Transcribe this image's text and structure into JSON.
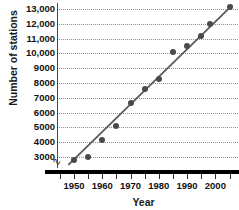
{
  "chart_data": {
    "type": "scatter",
    "title": "",
    "xlabel": "Year",
    "ylabel": "Number of stations",
    "xlim": [
      1944,
      2008
    ],
    "ylim": [
      2400,
      13400
    ],
    "grid": true,
    "legend": "none",
    "x_tick_labels": [
      "1950",
      "1960",
      "1970",
      "1980",
      "1990",
      "2000"
    ],
    "x_tick_values": [
      1950,
      1960,
      1970,
      1980,
      1990,
      2000
    ],
    "x_minor_tick_values": [
      1945,
      1950,
      1955,
      1960,
      1965,
      1970,
      1975,
      1980,
      1985,
      1990,
      1995,
      2000,
      2005
    ],
    "y_tick_labels": [
      "3000",
      "4000",
      "5000",
      "6000",
      "7000",
      "8000",
      "9000",
      "10,000",
      "11,000",
      "12,000",
      "13,000"
    ],
    "y_tick_values": [
      3000,
      4000,
      5000,
      6000,
      7000,
      8000,
      9000,
      10000,
      11000,
      12000,
      13000
    ],
    "axis_break": true,
    "x": [
      1950,
      1955,
      1960,
      1965,
      1970,
      1975,
      1980,
      1985,
      1990,
      1995,
      1998,
      2005
    ],
    "values": [
      2800,
      3000,
      4150,
      5100,
      6650,
      7600,
      8300,
      10100,
      10500,
      11200,
      12000,
      13100
    ],
    "points": [
      {
        "year": 1950,
        "stations": 2800
      },
      {
        "year": 1955,
        "stations": 3000
      },
      {
        "year": 1960,
        "stations": 4150
      },
      {
        "year": 1965,
        "stations": 5100
      },
      {
        "year": 1970,
        "stations": 6650
      },
      {
        "year": 1975,
        "stations": 7600
      },
      {
        "year": 1980,
        "stations": 8300
      },
      {
        "year": 1985,
        "stations": 10100
      },
      {
        "year": 1990,
        "stations": 10500
      },
      {
        "year": 1995,
        "stations": 11200
      },
      {
        "year": 1998,
        "stations": 12000
      },
      {
        "year": 2005,
        "stations": 13100
      }
    ],
    "trend_line": {
      "visible": true,
      "start": {
        "year": 1948,
        "stations": 2480
      },
      "end": {
        "year": 2006,
        "stations": 13250
      }
    },
    "colors": {
      "point": "#4a4a4a",
      "trend": "#5a5a5a",
      "grid": "#8d8d8d",
      "axis": "#000000",
      "text": "#111111",
      "background": "#ffffff"
    }
  }
}
